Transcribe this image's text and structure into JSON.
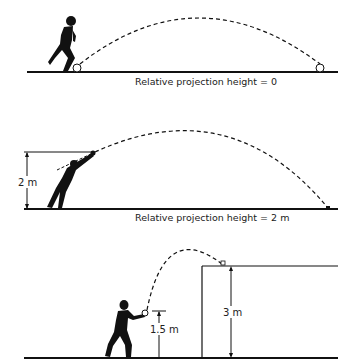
{
  "panels": [
    {
      "id": "ground-level",
      "caption": "Relative projection height = 0"
    },
    {
      "id": "elevated-release",
      "caption": "Relative projection height = 2 m",
      "dimension_label": "2 m"
    },
    {
      "id": "onto-platform",
      "release_height_label": "1.5 m",
      "platform_height_label": "3 m"
    }
  ],
  "colors": {
    "ink": "#111111",
    "background": "#ffffff"
  }
}
